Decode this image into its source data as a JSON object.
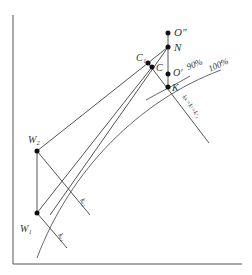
{
  "diagram": {
    "points": [
      {
        "id": "O2",
        "label": "O\"",
        "x": 168,
        "y": 33
      },
      {
        "id": "N",
        "label": "N",
        "x": 168,
        "y": 47
      },
      {
        "id": "C1",
        "label": "C₁",
        "x": 148,
        "y": 63
      },
      {
        "id": "C",
        "label": "C",
        "x": 152,
        "y": 67
      },
      {
        "id": "O1",
        "label": "O'",
        "x": 168,
        "y": 74
      },
      {
        "id": "K",
        "label": "K",
        "x": 168,
        "y": 87
      },
      {
        "id": "W2",
        "label": "W₂",
        "x": 37,
        "y": 151
      },
      {
        "id": "W1",
        "label": "W₁",
        "x": 37,
        "y": 213
      }
    ],
    "curve_labels": {
      "p90": "90%",
      "p100": "100%"
    },
    "line_labels": {
      "kw2": "kᵤ₂",
      "kw1": "kᵤ₁",
      "kk": "kₖ=kᶜ=kᶜ₁"
    }
  }
}
